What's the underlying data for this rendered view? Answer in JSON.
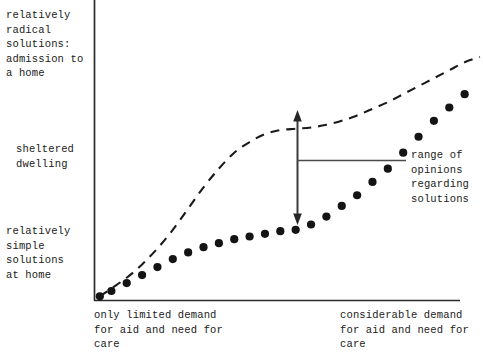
{
  "chart_data": {
    "type": "line",
    "title": "",
    "subtitle": "",
    "xlabel": "",
    "ylabel": "",
    "grid": false,
    "legend": "none",
    "xlim": [
      0,
      100
    ],
    "ylim": [
      0,
      100
    ],
    "x_tick_labels": [
      "only limited demand\nfor aid and need for\ncare",
      "considerable demand\nfor aid and need for\ncare"
    ],
    "y_tick_labels": [
      "relatively\nsimple\nsolutions\nat home",
      "sheltered\ndwelling",
      "relatively\nradical\nsolutions:\nadmission to\na home"
    ],
    "annotations": [
      {
        "name": "range-of-opinions",
        "text": "range of\nopinions\nregarding\nsolutions",
        "x": 55,
        "y_top": 62,
        "y_bottom": 26,
        "style": "double-headed-vertical-arrow-with-leader"
      }
    ],
    "series": [
      {
        "name": "upper-bound-opinion",
        "style": "dashed",
        "x": [
          1,
          4,
          8,
          12,
          16,
          20,
          24,
          28,
          32,
          36,
          40,
          44,
          48,
          52,
          56,
          60,
          64,
          68,
          72,
          76,
          80,
          84,
          88,
          92,
          96,
          100
        ],
        "y": [
          1,
          4,
          8,
          13,
          19,
          26,
          34,
          42,
          49,
          55,
          59,
          62,
          63.5,
          64,
          64.5,
          65.5,
          67,
          69,
          71.5,
          74,
          77,
          80,
          83,
          86,
          89,
          91
        ]
      },
      {
        "name": "lower-bound-opinion",
        "style": "dotted",
        "x": [
          1,
          4,
          8,
          12,
          16,
          20,
          24,
          28,
          32,
          36,
          40,
          44,
          48,
          52,
          56,
          60,
          64,
          68,
          72,
          76,
          80,
          84,
          88,
          92,
          96
        ],
        "y": [
          1,
          3,
          6,
          9,
          12,
          15,
          17.5,
          19.5,
          21,
          22.5,
          23.5,
          24.5,
          25.5,
          26,
          28,
          31,
          35,
          39,
          44,
          49,
          55,
          61,
          67,
          72,
          77
        ]
      }
    ]
  },
  "axis_labels": {
    "y_radical": "relatively\nradical\nsolutions:\nadmission to\na home",
    "y_sheltered": "sheltered\ndwelling",
    "y_simple": "relatively\nsimple\nsolutions\nat home",
    "x_left": "only limited demand\nfor aid and need for\ncare",
    "x_right": "considerable demand\nfor aid and need for\ncare"
  },
  "annotation": {
    "range_text": "range of\nopinions\nregarding\nsolutions"
  },
  "colors": {
    "ink": "#1a1a1a",
    "axis": "#2b2b2b",
    "arrow": "#3a3a3a",
    "background": "#ffffff"
  }
}
